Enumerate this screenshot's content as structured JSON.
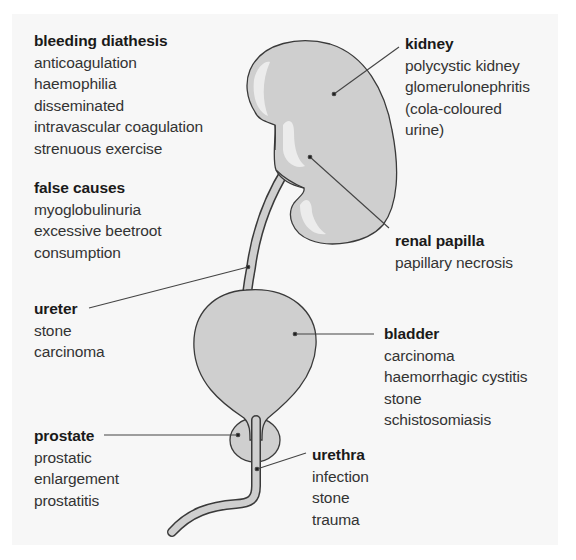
{
  "diagram": {
    "colors": {
      "organ_fill": "#cfcfcf",
      "organ_highlight": "#ececec",
      "outline": "#3a3a3a",
      "leader_line": "#444444",
      "panel_background": "#f7f7f7"
    }
  },
  "labels": {
    "bleeding": {
      "title": "bleeding diathesis",
      "items": [
        "anticoagulation",
        "haemophilia",
        "disseminated",
        "intravascular coagulation",
        "strenuous exercise"
      ]
    },
    "false_causes": {
      "title": "false causes",
      "items": [
        "myoglobulinuria",
        "excessive beetroot",
        "consumption"
      ]
    },
    "kidney": {
      "title": "kidney",
      "items": [
        "polycystic kidney",
        "glomerulonephritis",
        "(cola-coloured",
        "urine)"
      ]
    },
    "renal_papilla": {
      "title": "renal papilla",
      "items": [
        "papillary necrosis"
      ]
    },
    "ureter": {
      "title": "ureter",
      "items": [
        "stone",
        "carcinoma"
      ]
    },
    "bladder": {
      "title": "bladder",
      "items": [
        "carcinoma",
        "haemorrhagic cystitis",
        "stone",
        "schistosomiasis"
      ]
    },
    "prostate": {
      "title": "prostate",
      "items": [
        "prostatic",
        "enlargement",
        "prostatitis"
      ]
    },
    "urethra": {
      "title": "urethra",
      "items": [
        "infection",
        "stone",
        "trauma"
      ]
    }
  }
}
